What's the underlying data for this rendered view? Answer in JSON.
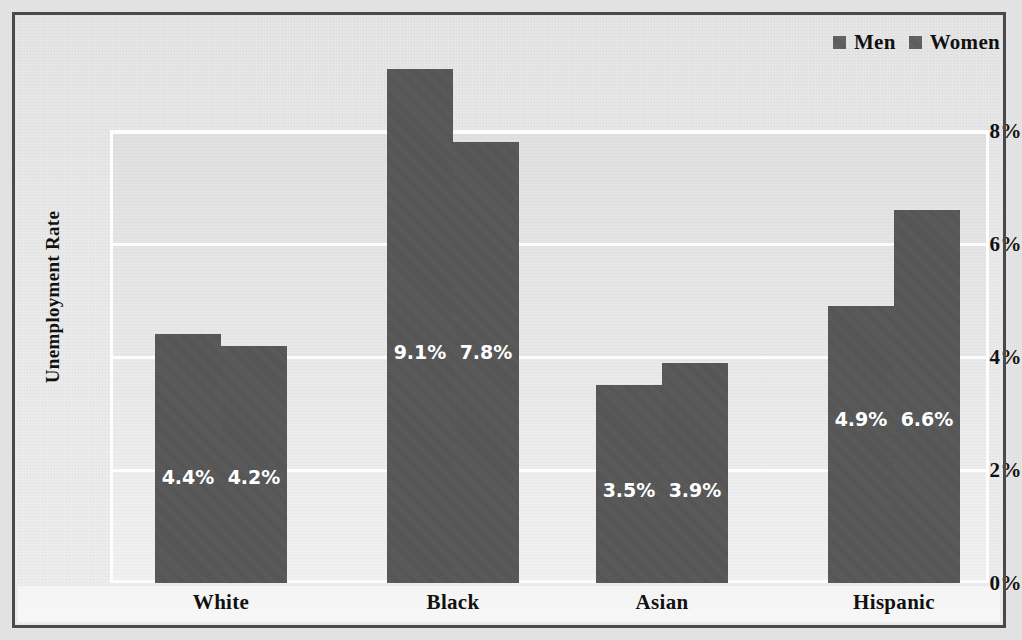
{
  "chart_data": {
    "type": "bar",
    "title": "",
    "subtitle": "",
    "xlabel": "",
    "ylabel": "Unemployment Rate",
    "categories": [
      "White",
      "Black",
      "Asian",
      "Hispanic"
    ],
    "series": [
      {
        "name": "Men",
        "values": [
          4.4,
          9.1,
          3.5,
          4.9
        ],
        "labels": [
          "4.4%",
          "9.1%",
          "3.5%",
          "4.9%"
        ],
        "color": "#565656"
      },
      {
        "name": "Women",
        "values": [
          4.2,
          7.8,
          3.9,
          6.6
        ],
        "labels": [
          "4.2%",
          "7.8%",
          "3.9%",
          "6.6%"
        ],
        "color": "#565656"
      }
    ],
    "ylim": [
      0,
      8.5
    ],
    "yticks": [
      0,
      2,
      4,
      6,
      8
    ],
    "ytick_labels": [
      "0%",
      "2%",
      "4%",
      "6%",
      "8%"
    ],
    "grid": "horizontal-only",
    "legend_position": "top-right",
    "bar_value_label_color": "#ffffff",
    "plot_background": "#e9e9e9",
    "gridline_color": "#fdfdfd",
    "border_color": "#4a4a4a"
  },
  "legend": {
    "items": [
      {
        "label": "Men"
      },
      {
        "label": "Women"
      }
    ]
  },
  "axis": {
    "y_title": "Unemployment Rate",
    "ticks": [
      {
        "label": "8%",
        "value": 8
      },
      {
        "label": "6%",
        "value": 6
      },
      {
        "label": "4%",
        "value": 4
      },
      {
        "label": "2%",
        "value": 2
      },
      {
        "label": "0%",
        "value": 0
      }
    ]
  },
  "groups": [
    {
      "category": "White",
      "bars": [
        {
          "series": "Men",
          "value": 4.4,
          "label": "4.4%"
        },
        {
          "series": "Women",
          "value": 4.2,
          "label": "4.2%"
        }
      ]
    },
    {
      "category": "Black",
      "bars": [
        {
          "series": "Men",
          "value": 9.1,
          "label": "9.1%"
        },
        {
          "series": "Women",
          "value": 7.8,
          "label": "7.8%"
        }
      ]
    },
    {
      "category": "Asian",
      "bars": [
        {
          "series": "Men",
          "value": 3.5,
          "label": "3.5%"
        },
        {
          "series": "Women",
          "value": 3.9,
          "label": "3.9%"
        }
      ]
    },
    {
      "category": "Hispanic",
      "bars": [
        {
          "series": "Men",
          "value": 4.9,
          "label": "4.9%"
        },
        {
          "series": "Women",
          "value": 6.6,
          "label": "6.6%"
        }
      ]
    }
  ]
}
